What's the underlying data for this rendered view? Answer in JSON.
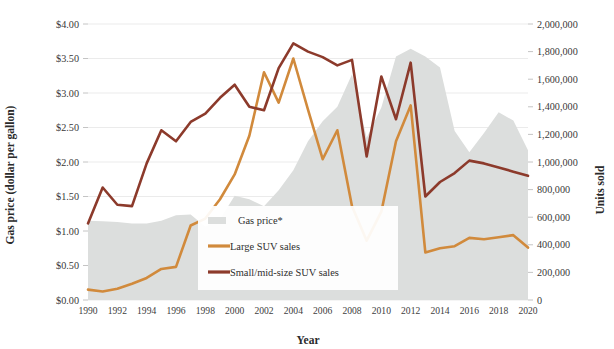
{
  "chart_data": {
    "type": "line",
    "title": "",
    "xlabel": "Year",
    "ylabel": "Gas price (dollar per gallon)",
    "y2label": "Units sold",
    "grid": true,
    "legend_position": "center-left-lower",
    "x": [
      1990,
      1991,
      1992,
      1993,
      1994,
      1995,
      1996,
      1997,
      1998,
      1999,
      2000,
      2001,
      2002,
      2003,
      2004,
      2005,
      2006,
      2007,
      2008,
      2009,
      2010,
      2011,
      2012,
      2013,
      2014,
      2015,
      2016,
      2017,
      2018,
      2019,
      2020
    ],
    "xtick_labels": [
      "1990",
      "1992",
      "1994",
      "1996",
      "1998",
      "2000",
      "2002",
      "2004",
      "2006",
      "2008",
      "2010",
      "2012",
      "2014",
      "2016",
      "2018",
      "2020"
    ],
    "xlim": [
      1990,
      2020
    ],
    "ylim": [
      0,
      4
    ],
    "ytick_labels": [
      "$0.00",
      "$0.50",
      "$1.00",
      "$1.50",
      "$2.00",
      "$2.50",
      "$3.00",
      "$3.50",
      "$4.00"
    ],
    "ytick_values": [
      0,
      0.5,
      1,
      1.5,
      2,
      2.5,
      3,
      3.5,
      4
    ],
    "y2lim": [
      0,
      2000000
    ],
    "y2tick_labels": [
      "0",
      "200,000",
      "400,000",
      "600,000",
      "800,000",
      "1,000,000",
      "1,200,000",
      "1,400,000",
      "1,600,000",
      "1,800,000",
      "2,000,000"
    ],
    "y2tick_values": [
      0,
      200000,
      400000,
      600000,
      800000,
      1000000,
      1200000,
      1400000,
      1600000,
      1800000,
      2000000
    ],
    "series": [
      {
        "name": "Gas price*",
        "type": "area",
        "axis": "left",
        "color": "#dcdedd",
        "values": [
          1.15,
          1.14,
          1.13,
          1.11,
          1.11,
          1.15,
          1.23,
          1.24,
          1.06,
          1.17,
          1.51,
          1.46,
          1.36,
          1.59,
          1.88,
          2.3,
          2.59,
          2.8,
          3.27,
          2.35,
          2.79,
          3.53,
          3.64,
          3.53,
          3.37,
          2.45,
          2.14,
          2.42,
          2.72,
          2.6,
          2.17
        ]
      },
      {
        "name": "Large SUV sales",
        "type": "line",
        "axis": "right",
        "color": "#d18a3c",
        "values": [
          75000,
          62000,
          82000,
          118000,
          160000,
          225000,
          240000,
          540000,
          590000,
          730000,
          910000,
          1190000,
          1650000,
          1430000,
          1750000,
          1380000,
          1020000,
          1230000,
          680000,
          430000,
          640000,
          1150000,
          1410000,
          345000,
          375000,
          390000,
          450000,
          440000,
          455000,
          470000,
          380000
        ]
      },
      {
        "name": "Small/mid-size SUV sales",
        "type": "line",
        "axis": "right",
        "color": "#8c3a2b",
        "values": [
          555000,
          815000,
          690000,
          680000,
          990000,
          1230000,
          1150000,
          1290000,
          1350000,
          1465000,
          1560000,
          1400000,
          1375000,
          1680000,
          1860000,
          1800000,
          1760000,
          1700000,
          1740000,
          1040000,
          1620000,
          1310000,
          1720000,
          750000,
          855000,
          920000,
          1010000,
          990000,
          960000,
          930000,
          900000
        ]
      }
    ]
  },
  "legend": {
    "items": [
      {
        "label": "Gas price*",
        "marker": "area-swatch",
        "color": "#dcdedd"
      },
      {
        "label": "Large SUV sales",
        "marker": "line-swatch",
        "color": "#d18a3c"
      },
      {
        "label": "Small/mid-size SUV sales",
        "marker": "line-swatch",
        "color": "#8c3a2b"
      }
    ]
  }
}
